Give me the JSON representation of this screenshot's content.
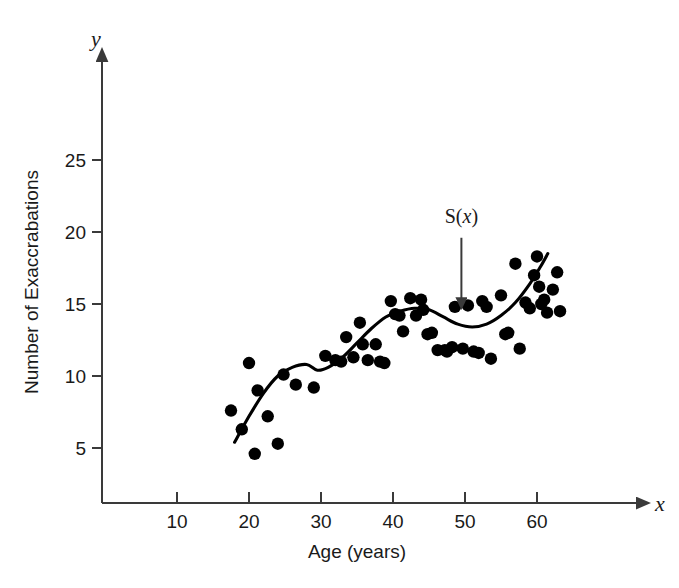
{
  "figure": {
    "background_color": "#ffffff",
    "ink_color": "#000000"
  },
  "chart_data": {
    "type": "scatter",
    "title": "",
    "xlabel": "Age (years)",
    "ylabel": "Number of Exaccrabations",
    "x_axis_name": "x",
    "y_axis_name": "y",
    "xlim": [
      0,
      68
    ],
    "ylim": [
      0,
      29
    ],
    "xticks": [
      10,
      20,
      30,
      40,
      50,
      60
    ],
    "xtick_labels": [
      "10",
      "20",
      "30",
      "40",
      "50",
      "60"
    ],
    "yticks": [
      5,
      10,
      15,
      20,
      25
    ],
    "ytick_labels": [
      "5",
      "10",
      "15",
      "20",
      "25"
    ],
    "grid": false,
    "legend": null,
    "annotations": [
      {
        "text": "S(x)",
        "text_italic_part": "x",
        "kind": "arrow-label",
        "label_x": 49.5,
        "label_y": 20.6,
        "arrow_from_x": 49.5,
        "arrow_from_y": 19.6,
        "arrow_to_x": 49.5,
        "arrow_to_y": 15.3,
        "describes": "smoothing-curve"
      }
    ],
    "points": [
      [
        17.5,
        7.6
      ],
      [
        19.0,
        6.3
      ],
      [
        20.0,
        10.9
      ],
      [
        20.8,
        4.6
      ],
      [
        21.2,
        9.0
      ],
      [
        22.6,
        7.2
      ],
      [
        24.0,
        5.3
      ],
      [
        24.8,
        10.1
      ],
      [
        26.5,
        9.4
      ],
      [
        29.0,
        9.2
      ],
      [
        30.6,
        11.4
      ],
      [
        32.0,
        11.1
      ],
      [
        32.8,
        11.0
      ],
      [
        33.5,
        12.7
      ],
      [
        34.5,
        11.3
      ],
      [
        35.4,
        13.7
      ],
      [
        35.8,
        12.2
      ],
      [
        36.5,
        11.1
      ],
      [
        37.6,
        12.2
      ],
      [
        38.2,
        11.0
      ],
      [
        38.8,
        10.9
      ],
      [
        39.7,
        15.2
      ],
      [
        40.3,
        14.3
      ],
      [
        40.9,
        14.2
      ],
      [
        41.4,
        13.1
      ],
      [
        42.4,
        15.4
      ],
      [
        43.2,
        14.2
      ],
      [
        43.9,
        15.3
      ],
      [
        44.2,
        14.6
      ],
      [
        44.8,
        12.9
      ],
      [
        45.4,
        13.0
      ],
      [
        46.2,
        11.8
      ],
      [
        47.2,
        11.8
      ],
      [
        47.5,
        11.7
      ],
      [
        48.2,
        12.0
      ],
      [
        48.6,
        14.8
      ],
      [
        49.7,
        11.9
      ],
      [
        50.4,
        14.9
      ],
      [
        51.2,
        11.7
      ],
      [
        51.9,
        11.6
      ],
      [
        52.4,
        15.2
      ],
      [
        53.0,
        14.8
      ],
      [
        53.6,
        11.2
      ],
      [
        55.0,
        15.6
      ],
      [
        55.6,
        12.9
      ],
      [
        56.0,
        13.0
      ],
      [
        57.0,
        17.8
      ],
      [
        57.6,
        11.9
      ],
      [
        58.4,
        15.1
      ],
      [
        59.0,
        14.7
      ],
      [
        59.6,
        17.0
      ],
      [
        60.0,
        18.3
      ],
      [
        60.3,
        16.2
      ],
      [
        60.6,
        15.0
      ],
      [
        61.0,
        15.3
      ],
      [
        61.4,
        14.4
      ],
      [
        62.2,
        16.0
      ],
      [
        62.8,
        17.2
      ],
      [
        63.2,
        14.5
      ]
    ],
    "smooth_curve": {
      "name": "S(x)",
      "description": "nonparametric smoothing spline fitted through the scatter",
      "x": [
        18.0,
        20.0,
        22.0,
        24.0,
        26.0,
        28.0,
        29.5,
        31.0,
        33.0,
        35.0,
        37.0,
        39.0,
        41.0,
        43.0,
        45.0,
        47.0,
        49.0,
        51.0,
        53.0,
        55.0,
        57.0,
        59.0,
        60.5,
        61.5
      ],
      "y": [
        5.4,
        7.2,
        8.8,
        10.0,
        10.6,
        10.8,
        10.4,
        10.6,
        11.3,
        12.3,
        13.3,
        14.1,
        14.5,
        14.7,
        14.6,
        14.1,
        13.6,
        13.4,
        13.6,
        14.2,
        15.1,
        16.4,
        17.6,
        18.5
      ]
    }
  }
}
